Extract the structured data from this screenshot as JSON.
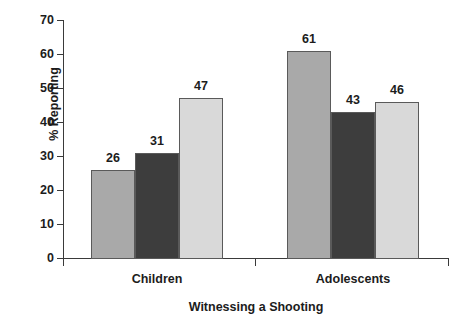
{
  "chart_data": {
    "type": "bar",
    "title": "",
    "xlabel": "Witnessing a Shooting",
    "ylabel": "% Reporting",
    "categories": [
      "Children",
      "Adolescents"
    ],
    "ylim": [
      0,
      70
    ],
    "yticks": [
      0,
      10,
      20,
      30,
      40,
      50,
      60,
      70
    ],
    "ytick_labels": [
      "0",
      "10",
      "20",
      "30",
      "40",
      "50",
      "60",
      "70"
    ],
    "grid": false,
    "legend": "none",
    "series": [
      {
        "name": "series-1",
        "color": "#a9a9a9",
        "values": [
          26,
          61
        ]
      },
      {
        "name": "series-2",
        "color": "#3d3d3d",
        "values": [
          31,
          43
        ]
      },
      {
        "name": "series-3",
        "color": "#d9d9d9",
        "values": [
          47,
          46
        ]
      }
    ],
    "bars": [
      {
        "group": "Children",
        "series": "series-1",
        "value": 26,
        "label": "26",
        "color": "#a9a9a9"
      },
      {
        "group": "Children",
        "series": "series-2",
        "value": 31,
        "label": "31",
        "color": "#3d3d3d"
      },
      {
        "group": "Children",
        "series": "series-3",
        "value": 47,
        "label": "47",
        "color": "#d9d9d9"
      },
      {
        "group": "Adolescents",
        "series": "series-1",
        "value": 61,
        "label": "61",
        "color": "#a9a9a9"
      },
      {
        "group": "Adolescents",
        "series": "series-2",
        "value": 43,
        "label": "43",
        "color": "#3d3d3d"
      },
      {
        "group": "Adolescents",
        "series": "series-3",
        "value": 46,
        "label": "46",
        "color": "#d9d9d9"
      }
    ]
  },
  "colors": {
    "axis": "#3a3a3a",
    "text": "#1c1c1c",
    "bar_border": "#5a5a5a",
    "background": "#ffffff"
  }
}
